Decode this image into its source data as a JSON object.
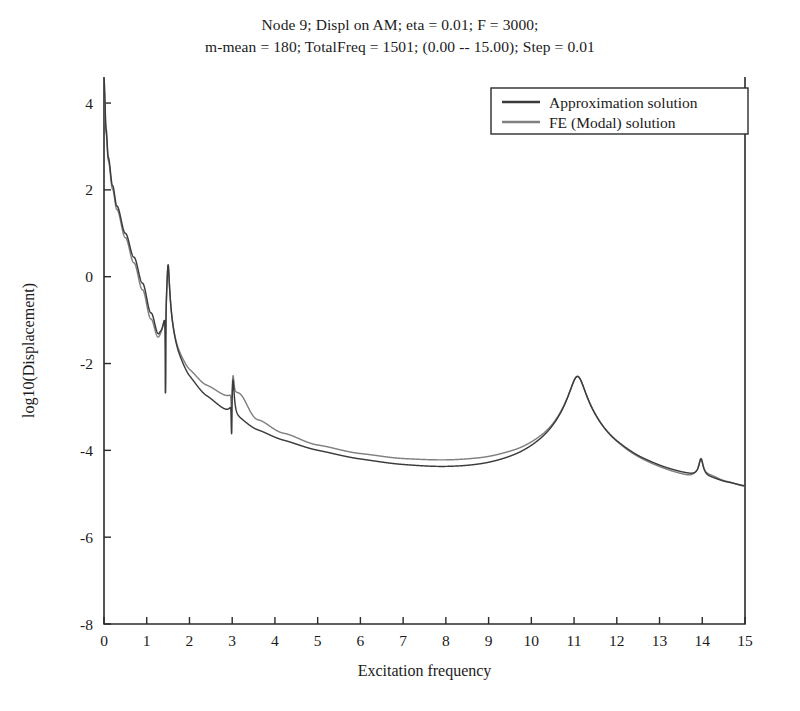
{
  "figure": {
    "title_line1": "Node 9; Displ on AM; eta = 0.01; F = 3000;",
    "title_line2": "m-mean = 180; TotalFreq = 1501; (0.00 -- 15.00); Step = 0.01"
  },
  "chart_data": {
    "type": "line",
    "title": "Node 9; Displ on AM; eta = 0.01; F = 3000; m-mean = 180; TotalFreq = 1501; (0.00 -- 15.00); Step = 0.01",
    "xlabel": "Excitation frequency",
    "ylabel": "log10(Displacement)",
    "xlim": [
      0,
      15
    ],
    "ylim": [
      -8,
      4.6
    ],
    "xticks": [
      0,
      1,
      2,
      3,
      4,
      5,
      6,
      7,
      8,
      9,
      10,
      11,
      12,
      13,
      14,
      15
    ],
    "xticklabels": [
      "0",
      "1",
      "2",
      "3",
      "4",
      "5",
      "6",
      "7",
      "8",
      "9",
      "10",
      "11",
      "12",
      "13",
      "14",
      "15"
    ],
    "yticks": [
      -8,
      -6,
      -4,
      -2,
      0,
      2,
      4
    ],
    "yticklabels": [
      "-8",
      "-6",
      "-4",
      "-2",
      "0",
      "2",
      "4"
    ],
    "grid": false,
    "legend_position": "top-right",
    "x_step": 0.01,
    "n_points": 1501,
    "series": [
      {
        "name": "Approximation solution",
        "color": "#3b3b3b",
        "baseline": {
          "x": [
            0.0,
            0.05,
            0.1,
            0.2,
            0.3,
            0.5,
            0.7,
            0.9,
            1.1,
            1.3,
            1.45,
            1.75,
            2.0,
            2.4,
            2.9,
            3.15,
            3.6,
            4.2,
            5.0,
            6.0,
            7.0,
            8.0,
            8.8,
            9.6,
            10.3,
            10.8,
            11.4,
            12.0,
            12.6,
            13.2,
            13.7,
            14.2,
            14.6,
            15.0
          ],
          "y": [
            4.55,
            3.4,
            2.75,
            2.1,
            1.63,
            1.0,
            0.45,
            -0.15,
            -0.85,
            -1.55,
            -1.95,
            -2.55,
            -2.85,
            -3.2,
            -3.52,
            -3.75,
            -4.15,
            -4.45,
            -4.75,
            -4.98,
            -5.12,
            -5.2,
            -5.2,
            -5.12,
            -4.95,
            -4.7,
            -4.65,
            -4.95,
            -5.3,
            -5.45,
            -5.45,
            -5.38,
            -5.62,
            -5.82
          ]
        },
        "resonances": [
          {
            "freq": 1.5,
            "peak": 0.3,
            "width": 0.022
          },
          {
            "freq": 3.02,
            "peak": -2.4,
            "width": 0.02
          },
          {
            "freq": 11.08,
            "peak": -2.3,
            "width": 0.16
          },
          {
            "freq": 13.97,
            "peak": -4.42,
            "width": 0.05
          }
        ],
        "antiresonances": [
          {
            "freq": 1.44,
            "depth": -4.2,
            "width": 0.016
          },
          {
            "freq": 2.985,
            "depth": -3.62,
            "width": 0.012
          }
        ]
      },
      {
        "name": "FE (Modal) solution",
        "color": "#808080",
        "baseline": {
          "x": [
            0.0,
            0.05,
            0.1,
            0.2,
            0.3,
            0.5,
            0.7,
            0.9,
            1.1,
            1.3,
            1.45,
            1.75,
            2.0,
            2.4,
            2.9,
            3.15,
            3.6,
            4.2,
            5.0,
            6.0,
            7.0,
            8.0,
            8.8,
            9.6,
            10.3,
            10.8,
            11.4,
            12.0,
            12.6,
            13.2,
            13.6,
            13.9,
            14.2,
            14.6,
            15.0
          ],
          "y": [
            4.38,
            3.3,
            2.68,
            2.02,
            1.55,
            0.9,
            0.32,
            -0.3,
            -1.0,
            -1.68,
            -1.98,
            -2.25,
            -2.45,
            -2.7,
            -2.9,
            -2.78,
            -3.55,
            -3.95,
            -4.3,
            -4.5,
            -4.6,
            -4.62,
            -4.6,
            -4.52,
            -4.4,
            -4.25,
            -4.35,
            -5.2,
            -6.1,
            -6.5,
            -6.3,
            -5.3,
            -5.2,
            -5.55,
            -5.95
          ]
        },
        "resonances": [
          {
            "freq": 1.5,
            "peak": 0.3,
            "width": 0.022
          },
          {
            "freq": 3.02,
            "peak": -2.4,
            "width": 0.02
          },
          {
            "freq": 11.08,
            "peak": -2.3,
            "width": 0.16
          },
          {
            "freq": 13.97,
            "peak": -4.42,
            "width": 0.05
          }
        ],
        "antiresonances": [
          {
            "freq": 1.44,
            "depth": -4.2,
            "width": 0.016
          },
          {
            "freq": 2.985,
            "depth": -3.6,
            "width": 0.012
          }
        ]
      }
    ]
  },
  "legend": {
    "items": [
      {
        "label": "Approximation solution",
        "color": "#3b3b3b"
      },
      {
        "label": "FE (Modal) solution",
        "color": "#808080"
      }
    ]
  }
}
